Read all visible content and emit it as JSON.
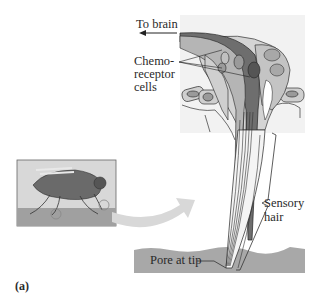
{
  "figure": {
    "panel_label": "(a)",
    "labels": {
      "to_brain": "To brain",
      "chemo_line1": "Chemo-",
      "chemo_line2": "receptor",
      "chemo_line3": "cells",
      "sensory_line1": "Sensory",
      "sensory_line2": "hair",
      "pore": "Pore at tip"
    },
    "inset": {
      "subject": "fly standing on surface",
      "icon": "fly-icon"
    },
    "colors": {
      "background_panel": "#f2f2f2",
      "surface": "#a8a8a8",
      "dark_cell": "#6e6e6e",
      "mid_cell": "#b5b5b5",
      "light_cell": "#d4d4d4",
      "arrow": "#d8d8d8"
    }
  }
}
